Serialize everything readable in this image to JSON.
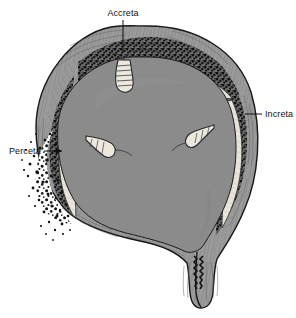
{
  "figure": {
    "background_color": "#ffffff"
  },
  "labels": [
    {
      "id": "accreta",
      "text": "Accreta",
      "position": "top-center",
      "leader": "vertical-line-down"
    },
    {
      "id": "increta",
      "text": "Increta",
      "position": "right",
      "leader": "horizontal-line-left"
    },
    {
      "id": "perceta",
      "text": "Perceta",
      "position": "left",
      "leader": "horizontal-arrow-right"
    }
  ],
  "anatomy": {
    "uterine_wall": {
      "name": "myometrium",
      "fill": "#9b9b9b",
      "stroke": "#161616",
      "striation_color": "#6a6a6a"
    },
    "uterine_cavity": {
      "name": "uterine-cavity",
      "fill": "#8b8b8b",
      "stroke": "#242424"
    },
    "placental_tissue": {
      "name": "placenta",
      "fill": "#2a2a2a",
      "description": "dark stippled villous tissue"
    },
    "membrane": {
      "name": "decidual-membrane",
      "fill": "#e8e4da",
      "stroke": "#3a3a3a"
    },
    "cervix": {
      "name": "cervix",
      "fill": "#9b9b9b",
      "stroke": "#161616"
    },
    "cord_stubs": {
      "name": "anchoring-villi",
      "fill": "#ece8de",
      "stroke": "#2b2b2b"
    }
  }
}
